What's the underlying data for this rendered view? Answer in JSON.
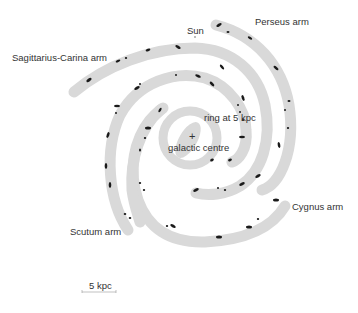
{
  "diagram": {
    "labels": {
      "sagittarius": "Sagittarius-Carina arm",
      "sun": "Sun",
      "perseus": "Perseus arm",
      "ring": "ring at 5 kpc",
      "centre_marker": "+",
      "centre": "galactic centre",
      "cygnus": "Cygnus arm",
      "scutum": "Scutum arm",
      "scale": "5 kpc"
    },
    "colors": {
      "arm_fill": "#d9d9d9",
      "hii_region": "#1a1a1a",
      "text": "#333333",
      "background": "#ffffff"
    },
    "elements": [
      "Sagittarius-Carina arm",
      "Perseus arm",
      "Cygnus arm",
      "Scutum arm",
      "ring at 5 kpc",
      "galactic centre",
      "Sun",
      "scale bar 5 kpc"
    ]
  }
}
